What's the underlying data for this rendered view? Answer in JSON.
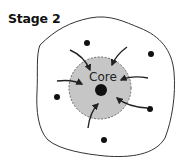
{
  "diagram": {
    "title": "Stage 2",
    "core_label": "Core",
    "colors": {
      "core_fill": "#c6c6c6",
      "core_border": "#666666",
      "outline": "#333333",
      "particle": "#111111",
      "arrow": "#222222"
    },
    "particles": [
      {
        "x": 87,
        "y": 43
      },
      {
        "x": 151,
        "y": 54
      },
      {
        "x": 57,
        "y": 97
      },
      {
        "x": 150,
        "y": 109
      },
      {
        "x": 104,
        "y": 140
      }
    ],
    "arrows": [
      {
        "from": [
          70,
          50
        ],
        "to": [
          90,
          70
        ]
      },
      {
        "from": [
          127,
          47
        ],
        "to": [
          112,
          65
        ]
      },
      {
        "from": [
          57,
          81
        ],
        "to": [
          82,
          84
        ]
      },
      {
        "from": [
          148,
          78
        ],
        "to": [
          121,
          80
        ]
      },
      {
        "from": [
          147,
          108
        ],
        "to": [
          117,
          98
        ]
      },
      {
        "from": [
          88,
          128
        ],
        "to": [
          98,
          104
        ]
      }
    ]
  }
}
